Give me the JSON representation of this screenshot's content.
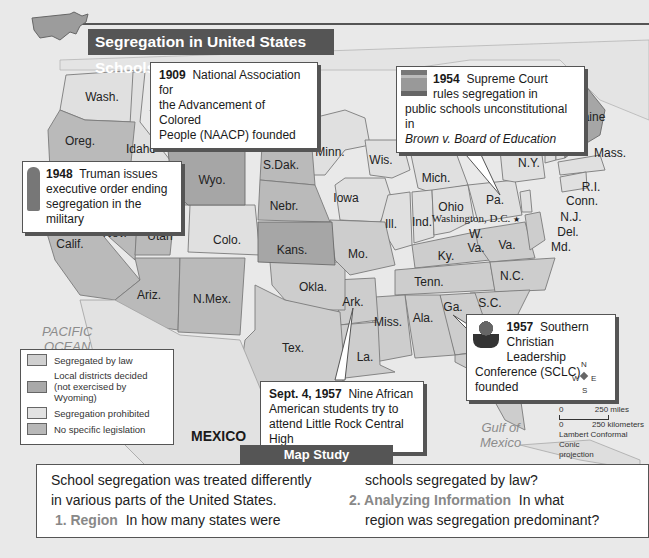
{
  "title": "Segregation in United States Schools, 1950",
  "legend": {
    "items": [
      {
        "label": "Segregated by law",
        "color": "#d0d0d0"
      },
      {
        "label": "Local districts decided\n(not exercised by Wyoming)",
        "label_line1": "Local districts decided",
        "label_line2": "(not exercised by Wyoming)",
        "color": "#a9a9a9"
      },
      {
        "label": "Segregation prohibited",
        "color": "#e2e2e2"
      },
      {
        "label": "No specific legislation",
        "color": "#b8b8b8"
      }
    ]
  },
  "callouts": {
    "naacp": {
      "year": "1909",
      "text_line1": "National Association for",
      "text_line2": "the Advancement of Colored",
      "text_line3": "People (NAACP) founded"
    },
    "brown": {
      "year": "1954",
      "text_line1": "Supreme Court",
      "text_line2": "rules segregation in",
      "text_line3": "public schools unconstitutional in",
      "text_line4_italic": "Brown v. Board of Education"
    },
    "truman": {
      "year": "1948",
      "text_line1": "Truman issues",
      "text_line2": "executive order ending",
      "text_line3": "segregation in the military"
    },
    "sclc": {
      "year": "1957",
      "text_line1": "Southern",
      "text_line2": "Christian Leadership",
      "text_line3": "Conference (SCLC) founded"
    },
    "little_rock": {
      "year": "Sept. 4, 1957",
      "text_line1": "Nine African",
      "text_line2": "American students try to",
      "text_line3": "attend Little Rock Central High"
    }
  },
  "states": [
    {
      "name": "Wash.",
      "x": 102,
      "y": 97
    },
    {
      "name": "Oreg.",
      "x": 80,
      "y": 141
    },
    {
      "name": "Idaho",
      "x": 141,
      "y": 149
    },
    {
      "name": "Mont.",
      "x": 220,
      "y": 130
    },
    {
      "name": "N.Dak",
      "x": 279,
      "y": 129
    },
    {
      "name": "S.Dak.",
      "x": 281,
      "y": 165
    },
    {
      "name": "Wyo.",
      "x": 212,
      "y": 180
    },
    {
      "name": "Minn.",
      "x": 330,
      "y": 152
    },
    {
      "name": "Wis.",
      "x": 381,
      "y": 160
    },
    {
      "name": "Mich.",
      "x": 436,
      "y": 178
    },
    {
      "name": "Nebr.",
      "x": 284,
      "y": 206
    },
    {
      "name": "Iowa",
      "x": 346,
      "y": 198
    },
    {
      "name": "Calif.",
      "x": 70,
      "y": 244
    },
    {
      "name": "Nev.",
      "x": 115,
      "y": 233
    },
    {
      "name": "Utah",
      "x": 160,
      "y": 236
    },
    {
      "name": "Colo.",
      "x": 227,
      "y": 240
    },
    {
      "name": "Kans.",
      "x": 292,
      "y": 250
    },
    {
      "name": "Mo.",
      "x": 358,
      "y": 254
    },
    {
      "name": "Ill.",
      "x": 391,
      "y": 224
    },
    {
      "name": "Ind.",
      "x": 422,
      "y": 222
    },
    {
      "name": "Ohio",
      "x": 451,
      "y": 207
    },
    {
      "name": "Pa.",
      "x": 495,
      "y": 200
    },
    {
      "name": "N.Y.",
      "x": 529,
      "y": 163
    },
    {
      "name": "Vt.",
      "x": 535,
      "y": 126
    },
    {
      "name": "N.H.",
      "x": 553,
      "y": 113
    },
    {
      "name": "Maine",
      "x": 589,
      "y": 117
    },
    {
      "name": "Mass.",
      "x": 610,
      "y": 153
    },
    {
      "name": "R.I.",
      "x": 591,
      "y": 187
    },
    {
      "name": "Conn.",
      "x": 582,
      "y": 201
    },
    {
      "name": "N.J.",
      "x": 571,
      "y": 217
    },
    {
      "name": "Del.",
      "x": 568,
      "y": 232
    },
    {
      "name": "Md.",
      "x": 561,
      "y": 247
    },
    {
      "name": "W.",
      "x": 476,
      "y": 234
    },
    {
      "name": "Va.",
      "x": 476,
      "y": 248
    },
    {
      "name": "Va.",
      "x": 507,
      "y": 245
    },
    {
      "name": "Ky.",
      "x": 446,
      "y": 256
    },
    {
      "name": "Tenn.",
      "x": 429,
      "y": 282
    },
    {
      "name": "N.C.",
      "x": 512,
      "y": 276
    },
    {
      "name": "S.C.",
      "x": 490,
      "y": 303
    },
    {
      "name": "Ga.",
      "x": 453,
      "y": 307
    },
    {
      "name": "Ala.",
      "x": 423,
      "y": 318
    },
    {
      "name": "Miss.",
      "x": 388,
      "y": 322
    },
    {
      "name": "Ark.",
      "x": 353,
      "y": 302
    },
    {
      "name": "La.",
      "x": 365,
      "y": 357
    },
    {
      "name": "Okla.",
      "x": 313,
      "y": 287
    },
    {
      "name": "Tex.",
      "x": 293,
      "y": 348
    },
    {
      "name": "Ariz.",
      "x": 149,
      "y": 295
    },
    {
      "name": "N.Mex.",
      "x": 212,
      "y": 299
    },
    {
      "name": "Fla.",
      "x": 495,
      "y": 381
    }
  ],
  "capital": {
    "name": "Washington, D.C."
  },
  "water": {
    "pacific": {
      "line1": "PACIFIC",
      "line2": "OCEAN"
    },
    "gulf": {
      "line1": "Gulf of",
      "line2": "Mexico"
    }
  },
  "mexico_label": "MEXICO",
  "scale_bar": {
    "miles_zero": "0",
    "miles_label": "250 miles",
    "km_zero": "0",
    "km_label": "250 kilometers",
    "projection_line1": "Lambert Conformal Conic",
    "projection_line2": "projection"
  },
  "compass": {
    "n": "N",
    "s": "S",
    "e": "E",
    "w": "W"
  },
  "map_study": {
    "tab_label": "Map Study",
    "intro_line1": "School segregation was treated differently",
    "intro_line2": "in various parts of the United States.",
    "q1_number": "1. Region",
    "q1_text_a": "In how many states were",
    "q1_text_b": "schools segregated by law?",
    "q2_number": "2. Analyzing Information",
    "q2_text_a": "In what",
    "q2_text_b": "region was segregation predominant?"
  }
}
